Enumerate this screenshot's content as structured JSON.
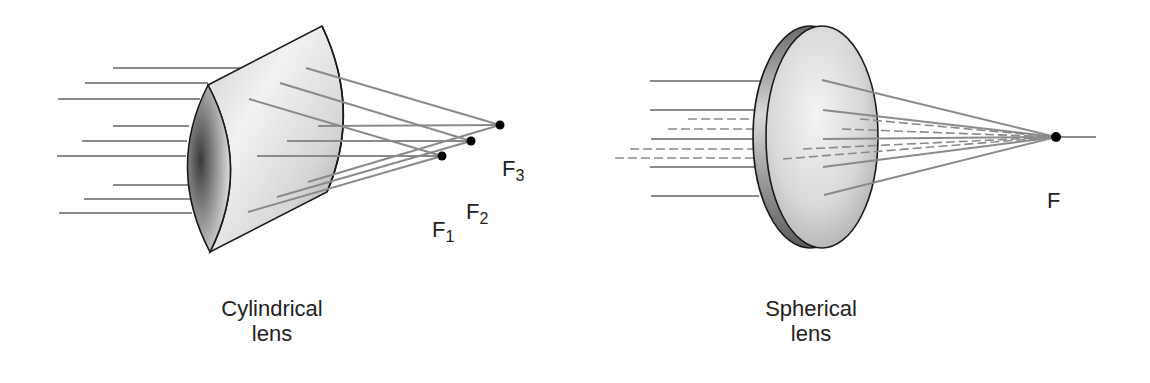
{
  "diagram": {
    "colors": {
      "ray": "#8a8a8a",
      "lens_edge": "#1a1a1a",
      "lens_fill_light": "#f4f4f4",
      "lens_fill_dark": "#555555",
      "focal_point": "#000000"
    },
    "cylindrical": {
      "caption_line1": "Cylindrical",
      "caption_line2": "lens",
      "focal_points": [
        {
          "label": "F",
          "sub": "1",
          "x": 442,
          "y": 156
        },
        {
          "label": "F",
          "sub": "2",
          "x": 471,
          "y": 141
        },
        {
          "label": "F",
          "sub": "3",
          "x": 500,
          "y": 125
        }
      ],
      "incoming_ray_count": 9
    },
    "spherical": {
      "caption_line1": "Spherical",
      "caption_line2": "lens",
      "focal_point": {
        "label": "F",
        "x": 1056,
        "y": 137
      },
      "solid_ray_count": 5,
      "dashed_ray_count": 4
    }
  }
}
